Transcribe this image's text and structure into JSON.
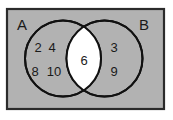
{
  "diagram": {
    "type": "venn-two-set",
    "universe_rect": {
      "fill_color": "#b2b2b2",
      "border_color": "#2b2b2b"
    },
    "sets": [
      {
        "id": "A",
        "label": "A",
        "label_position": "top-left",
        "outline_color": "#111111",
        "only_elements": [
          "2",
          "4",
          "8",
          "10"
        ],
        "only_rows": [
          [
            "2",
            "4"
          ],
          [
            "8",
            "10"
          ]
        ]
      },
      {
        "id": "B",
        "label": "B",
        "label_position": "top-right",
        "outline_color": "#111111",
        "only_elements": [
          "3",
          "9"
        ],
        "only_rows": [
          [
            "3"
          ],
          [
            "9"
          ]
        ]
      }
    ],
    "intersection": {
      "label": "A ∩ B",
      "fill_color": "#ffffff",
      "elements": [
        "6"
      ],
      "rows": [
        [
          "6"
        ]
      ]
    }
  }
}
